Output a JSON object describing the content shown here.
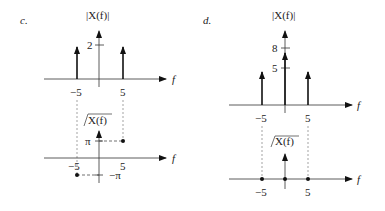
{
  "panels": [
    {
      "id": "c",
      "label": "c.",
      "magnitude": {
        "title": "|X(f)|",
        "xlabel": "f",
        "tick_label": "2",
        "impulses": [
          {
            "f": -5,
            "height": 2
          },
          {
            "f": 5,
            "height": 2
          }
        ],
        "x_ticks": [
          "−5",
          "5"
        ]
      },
      "phase": {
        "title": "X(f)",
        "xlabel": "f",
        "y_ticks": [
          "π",
          "−π"
        ],
        "points": [
          {
            "f": -5,
            "phase": "−π"
          },
          {
            "f": 5,
            "phase": "π"
          }
        ],
        "x_ticks": [
          "−5",
          "5"
        ]
      }
    },
    {
      "id": "d",
      "label": "d.",
      "magnitude": {
        "title": "|X(f)|",
        "xlabel": "f",
        "tick_labels": [
          "8",
          "5"
        ],
        "impulses": [
          {
            "f": -5,
            "height": 5
          },
          {
            "f": 0,
            "height": 8
          },
          {
            "f": 5,
            "height": 5
          }
        ],
        "x_ticks": [
          "−5",
          "5"
        ]
      },
      "phase": {
        "title": "X(f)",
        "xlabel": "f",
        "points": [
          {
            "f": -5,
            "phase": 0
          },
          {
            "f": 0,
            "phase": 0
          },
          {
            "f": 5,
            "phase": 0
          }
        ],
        "x_ticks": [
          "−5",
          "5"
        ]
      }
    }
  ]
}
